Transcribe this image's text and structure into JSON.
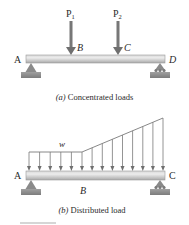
{
  "figure_a": {
    "caption_prefix": "(a)",
    "caption_text": " Concentrated loads",
    "points": {
      "left": "A",
      "load1": "B",
      "load2": "C",
      "right": "D"
    },
    "loads": [
      {
        "label": "P",
        "subscript": "1"
      },
      {
        "label": "P",
        "subscript": "2"
      }
    ],
    "supports": {
      "left": "pin",
      "right": "roller"
    }
  },
  "figure_b": {
    "caption_prefix": "(b)",
    "caption_text": " Distributed load",
    "points": {
      "left": "A",
      "mid": "B",
      "right": "C"
    },
    "load_label": "w",
    "load_profile": {
      "uniform_segment": "A to B",
      "linear_increasing_segment": "B to C",
      "arrow_count": 14
    },
    "supports": {
      "left": "pin",
      "right": "roller"
    }
  },
  "colors": {
    "beam_light": "#e4e4e4",
    "beam_dark": "#a8a8a8",
    "arrow": "#6f6f6f",
    "support": "#8a8a8a",
    "text": "#2a2a2a"
  }
}
